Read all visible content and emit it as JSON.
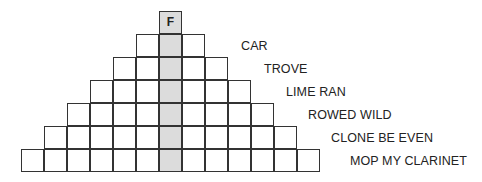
{
  "puzzle": {
    "top_letter": "F",
    "shaded_column_color": "#dcdcdc",
    "rows": [
      {
        "length": 1,
        "clue": ""
      },
      {
        "length": 3,
        "clue": "CAR"
      },
      {
        "length": 5,
        "clue": "TROVE"
      },
      {
        "length": 7,
        "clue": "LIME RAN"
      },
      {
        "length": 9,
        "clue": "ROWED WILD"
      },
      {
        "length": 11,
        "clue": "CLONE BE EVEN"
      },
      {
        "length": 13,
        "clue": "MOP MY CLARINET"
      }
    ],
    "clues": [
      "CAR",
      "TROVE",
      "LIME RAN",
      "ROWED WILD",
      "CLONE BE EVEN",
      "MOP MY CLARINET"
    ]
  }
}
